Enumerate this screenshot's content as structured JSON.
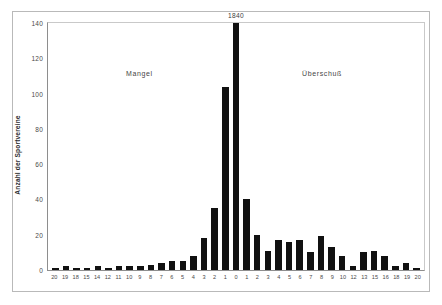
{
  "chart_data": {
    "type": "bar",
    "title": "",
    "xlabel": "",
    "ylabel": "Anzahl der Sportvereine",
    "ylim": [
      0,
      140
    ],
    "yticks": [
      0,
      20,
      40,
      60,
      80,
      100,
      120,
      140
    ],
    "grid": false,
    "legend": "none",
    "categories": [
      "20",
      "19",
      "18",
      "15",
      "14",
      "12",
      "11",
      "10",
      "9",
      "8",
      "7",
      "6",
      "5",
      "4",
      "3",
      "2",
      "1",
      "0",
      "1",
      "2",
      "3",
      "4",
      "5",
      "6",
      "7",
      "8",
      "9",
      "10",
      "12",
      "13",
      "15",
      "16",
      "18",
      "19",
      "20"
    ],
    "values": [
      1,
      2,
      1,
      1,
      2,
      1,
      2,
      2,
      2,
      3,
      4,
      5,
      5,
      8,
      18,
      35,
      104,
      140,
      40,
      20,
      11,
      17,
      16,
      17,
      10,
      19,
      13,
      8,
      2,
      10,
      11,
      8,
      2,
      4,
      1
    ],
    "annotations": [
      {
        "name": "peak-value",
        "text": "1840",
        "category": "0",
        "value": 140
      },
      {
        "name": "region-left",
        "text": "Mangel",
        "category": "9"
      },
      {
        "name": "region-right",
        "text": "Überschuß",
        "category": "5r"
      }
    ],
    "colors": {
      "bar": "#111111",
      "axis": "#8e8e8e",
      "frame": "#b9b9b9",
      "text": "#3a3a3a",
      "background": "#ffffff"
    }
  },
  "figure": {
    "y_axis_title": "Anzahl der Sportvereine",
    "peak_annotation": "1840",
    "region_left_label": "Mangel",
    "region_right_label": "Überschuß"
  }
}
